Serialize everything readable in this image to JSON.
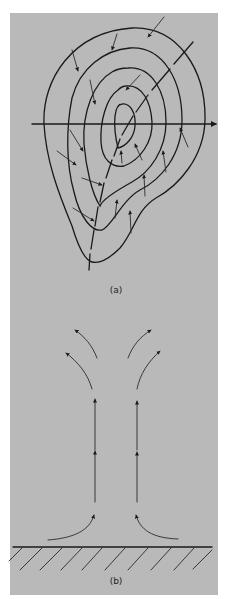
{
  "figure": {
    "background_color": "#b9b9b9",
    "line_color": "#1a1a1a",
    "panels": [
      {
        "id": "a",
        "label": "(a)",
        "description": "Closed concentric contours (isobars) around a center, a horizontal axis with arrow to the right, a dashed trough line running from upper right to lower left, and small arrows indicating inflow toward the dashed line"
      },
      {
        "id": "b",
        "label": "(b)",
        "description": "Vertical cross-section: air converges along the hatched ground surface, rises in two vertical columns of arrows, and diverges outward at the top"
      }
    ]
  }
}
